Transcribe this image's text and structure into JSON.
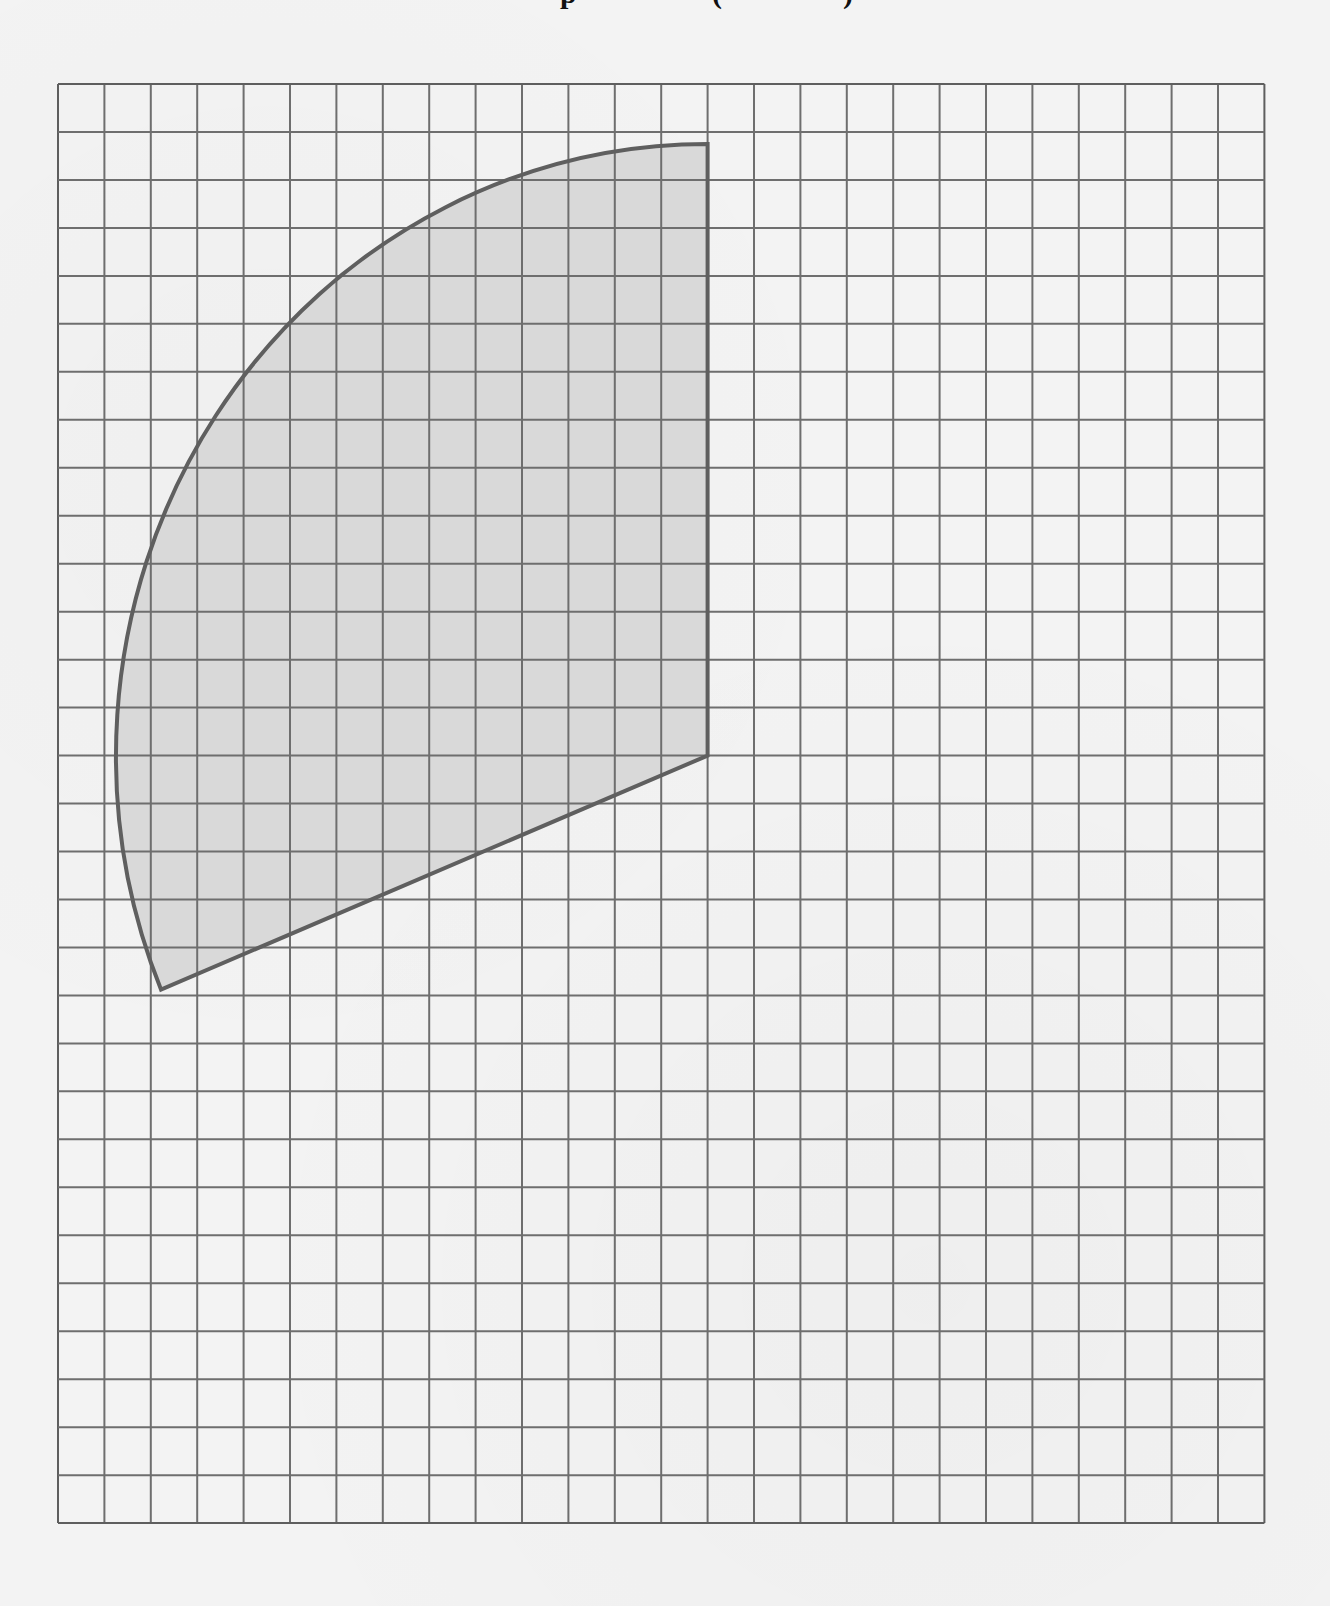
{
  "page": {
    "title_fragments": [
      {
        "glyph": "p",
        "x": 560
      },
      {
        "glyph": "(",
        "x": 712
      },
      {
        "glyph": ")",
        "x": 843
      }
    ],
    "title_note": "Title is cropped at the top edge; only descender fragments are visible."
  },
  "grid": {
    "origin_px": [
      58,
      84
    ],
    "columns": 26,
    "rows": 30,
    "cell_width_px": 46.4,
    "cell_height_px": 47.97,
    "line_color": "#6e6e6e",
    "border_color": "#5e5e5e"
  },
  "shape": {
    "type": "circular-sector",
    "center_grid": [
      14,
      14
    ],
    "radius_grid_units": 12.75,
    "start_angle_deg": 90,
    "end_angle_deg": 202.5,
    "sweep_deg": 112.5,
    "vertices_grid": {
      "top": [
        14,
        1.25
      ],
      "center": [
        14,
        14
      ],
      "bottom_left": [
        2.22,
        18.88
      ]
    },
    "fill_color": "#d9d9d9",
    "stroke_color": "#5f5f5f"
  },
  "colors": {
    "background": "#f3f3f3"
  }
}
